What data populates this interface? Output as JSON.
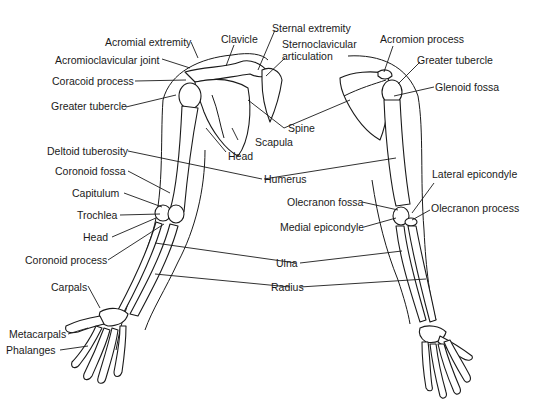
{
  "diagram": {
    "views": [
      "anterior",
      "posterior"
    ],
    "labels": {
      "acromial_extremity": "Acromial extremity",
      "clavicle": "Clavicle",
      "sternal_extremity": "Sternal extremity",
      "sternoclavicular_1": "Sternoclavicular",
      "sternoclavicular_2": "articulation",
      "acromioclavicular_joint": "Acromioclavicular joint",
      "coracoid_process": "Coracoid process",
      "greater_tubercle_left": "Greater tubercle",
      "scapula": "Scapula",
      "head_humerus": "Head",
      "spine": "Spine",
      "deltoid_tuberosity": "Deltoid tuberosity",
      "coronoid_fossa": "Coronoid fossa",
      "capitulum": "Capitulum",
      "trochlea": "Trochlea",
      "head_radius": "Head",
      "coronoid_process": "Coronoid process",
      "carpals": "Carpals",
      "metacarpals": "Metacarpals",
      "phalanges": "Phalanges",
      "humerus": "Humerus",
      "ulna": "Ulna",
      "radius": "Radius",
      "acromion_process": "Acromion process",
      "greater_tubercle_right": "Greater tubercle",
      "glenoid_fossa": "Glenoid fossa",
      "lateral_epicondyle": "Lateral epicondyle",
      "olecranon_fossa": "Olecranon fossa",
      "olecranon_process": "Olecranon process",
      "medial_epicondyle": "Medial epicondyle"
    }
  }
}
